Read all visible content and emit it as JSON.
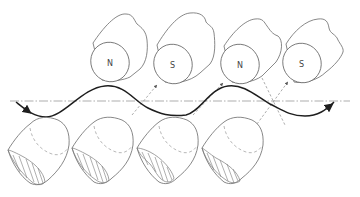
{
  "diagram": {
    "type": "magnetic-undulator-schematic",
    "upper_magnets": [
      {
        "label": "N",
        "cx": 110,
        "cy": 62
      },
      {
        "label": "S",
        "cx": 173,
        "cy": 64
      },
      {
        "label": "N",
        "cx": 240,
        "cy": 64
      },
      {
        "label": "S",
        "cx": 302,
        "cy": 63
      }
    ],
    "lower_blocks": [
      {
        "index": 1,
        "hatched_face": true
      },
      {
        "index": 2,
        "hatched_face": true
      },
      {
        "index": 3,
        "hatched_face": true
      },
      {
        "index": 4,
        "hatched_face": true
      }
    ],
    "axis": {
      "style": "dash-dot",
      "y": 101
    },
    "trajectory": {
      "shape": "sinusoid",
      "direction": "left-to-right",
      "color": "#1e1e1e"
    },
    "field_arrows": {
      "style": "dashed",
      "count": 4
    },
    "colors": {
      "line": "#6a6a6a",
      "trajectory": "#1e1e1e",
      "background": "#ffffff"
    }
  }
}
